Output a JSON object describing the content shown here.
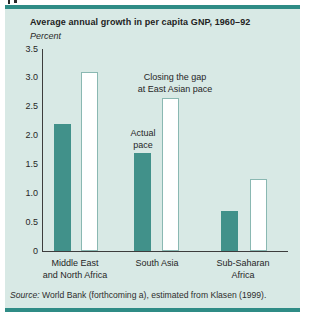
{
  "figure": {
    "title": "Average annual growth in per capita GNP, 1960–92",
    "unit_label": "Percent",
    "source_prefix": "Source:",
    "source_rest": " World Bank (forthcoming a), estimated from Klasen (1999)."
  },
  "chart_data": {
    "type": "bar",
    "title": "Average annual growth in per capita GNP, 1960–92",
    "xlabel": "",
    "ylabel": "Percent",
    "ylim": [
      0,
      3.5
    ],
    "yticks": [
      3.5,
      3.0,
      2.5,
      2.0,
      1.5,
      1.0,
      0.5,
      0
    ],
    "ytick_labels": [
      "3.5",
      "3.0",
      "2.5",
      "2.0",
      "1.5",
      "1.0",
      "0.5",
      "0"
    ],
    "grid": false,
    "legend_position": "none",
    "categories": [
      "Middle East and North Africa",
      "South Asia",
      "Sub-Saharan Africa"
    ],
    "category_label_lines": [
      [
        "Middle East",
        "and North Africa"
      ],
      [
        "South Asia"
      ],
      [
        "Sub-Saharan",
        "Africa"
      ]
    ],
    "series": [
      {
        "name": "Actual pace",
        "values": [
          2.2,
          1.7,
          0.7
        ],
        "fill": "#41918a"
      },
      {
        "name": "Closing the gap at East Asian pace",
        "values": [
          3.1,
          2.65,
          1.25
        ],
        "fill": "#ffffff"
      }
    ],
    "annotations": [
      {
        "lines": [
          "Closing the gap",
          "at East Asian pace"
        ],
        "points_to": "South Asia white bar"
      },
      {
        "lines": [
          "Actual",
          "pace"
        ],
        "points_to": "South Asia teal bar"
      }
    ]
  },
  "colors": {
    "panel_background": "#d8e9e5",
    "rule_teal": "#2f8c86",
    "bar_teal": "#41918a",
    "bar_white": "#ffffff",
    "bar_white_outline": "#8ab8b2",
    "axis_line": "#3d3d3d",
    "text": "#262626"
  }
}
